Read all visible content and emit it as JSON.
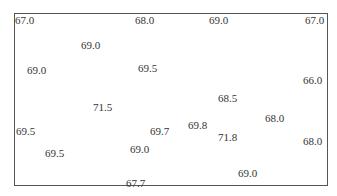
{
  "chart_data": {
    "type": "scatter",
    "title": "",
    "xlabel": "",
    "ylabel": "",
    "grid": false,
    "legend": null,
    "points": [
      {
        "label": "67.0",
        "x": 15,
        "y": 14
      },
      {
        "label": "68.0",
        "x": 135,
        "y": 14
      },
      {
        "label": "69.0",
        "x": 209,
        "y": 14
      },
      {
        "label": "67.0",
        "x": 305,
        "y": 14
      },
      {
        "label": "69.0",
        "x": 81,
        "y": 39
      },
      {
        "label": "69.0",
        "x": 27,
        "y": 64
      },
      {
        "label": "69.5",
        "x": 138,
        "y": 62
      },
      {
        "label": "66.0",
        "x": 303,
        "y": 74
      },
      {
        "label": "68.5",
        "x": 218,
        "y": 92
      },
      {
        "label": "71.5",
        "x": 93,
        "y": 101
      },
      {
        "label": "68.0",
        "x": 265,
        "y": 112
      },
      {
        "label": "69.5",
        "x": 16,
        "y": 125
      },
      {
        "label": "69.7",
        "x": 150,
        "y": 125
      },
      {
        "label": "69.8",
        "x": 188,
        "y": 119
      },
      {
        "label": "71.8",
        "x": 218,
        "y": 131
      },
      {
        "label": "68.0",
        "x": 303,
        "y": 135
      },
      {
        "label": "69.0",
        "x": 130,
        "y": 143
      },
      {
        "label": "69.5",
        "x": 45,
        "y": 147
      },
      {
        "label": "69.0",
        "x": 238,
        "y": 167
      },
      {
        "label": "67.7",
        "x": 126,
        "y": 177
      }
    ]
  }
}
